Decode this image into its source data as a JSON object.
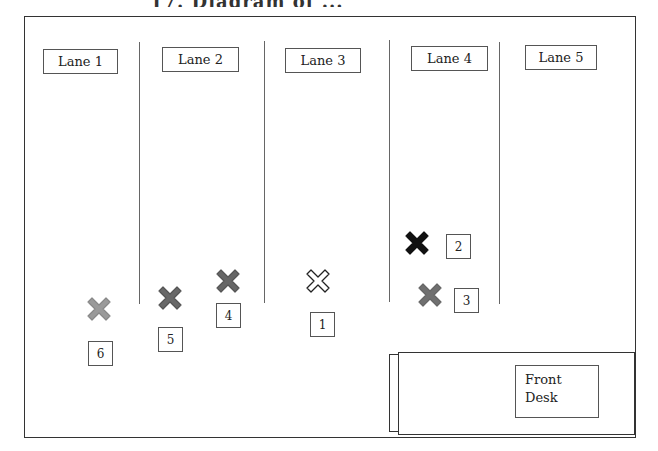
{
  "title_fragment": "17. Diagram of ...",
  "lanes": [
    {
      "label": "Lane 1"
    },
    {
      "label": "Lane 2"
    },
    {
      "label": "Lane 3"
    },
    {
      "label": "Lane 4"
    },
    {
      "label": "Lane 5"
    }
  ],
  "markers": [
    {
      "number": "1",
      "style": "outline",
      "color": "#ffffff",
      "stroke": "#222222"
    },
    {
      "number": "2",
      "style": "filled",
      "color": "#111111",
      "stroke": "#111111"
    },
    {
      "number": "3",
      "style": "filled",
      "color": "#707070",
      "stroke": "#666666"
    },
    {
      "number": "4",
      "style": "filled",
      "color": "#666666",
      "stroke": "#555555"
    },
    {
      "number": "5",
      "style": "filled",
      "color": "#686868",
      "stroke": "#555555"
    },
    {
      "number": "6",
      "style": "filled",
      "color": "#9a9a9a",
      "stroke": "#888888"
    }
  ],
  "front_desk": {
    "line1": "Front",
    "line2": "Desk"
  }
}
